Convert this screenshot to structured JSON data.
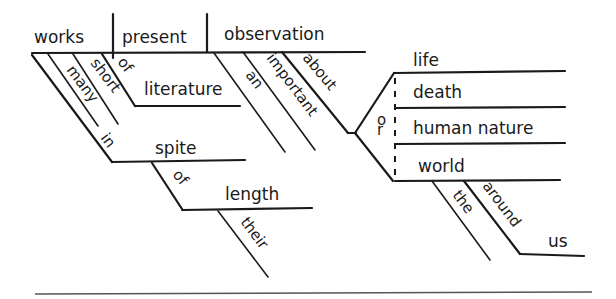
{
  "diagram": {
    "type": "Reed-Kellogg sentence diagram",
    "sentence_words": {
      "subject": "works",
      "verb": "present",
      "direct_object": "observation",
      "subject_modifiers": [
        "many",
        "short"
      ],
      "prep_of_1": "of",
      "object_literature": "literature",
      "prep_in": "in",
      "object_spite": "spite",
      "prep_of_2": "of",
      "object_length": "length",
      "length_modifier": "their",
      "object_modifiers": [
        "an",
        "important"
      ],
      "prep_about": "about",
      "conjunction": "or",
      "compound_objects": [
        "life",
        "death",
        "human nature",
        "world"
      ],
      "world_modifier": "the",
      "prep_around": "around",
      "object_us": "us"
    }
  }
}
